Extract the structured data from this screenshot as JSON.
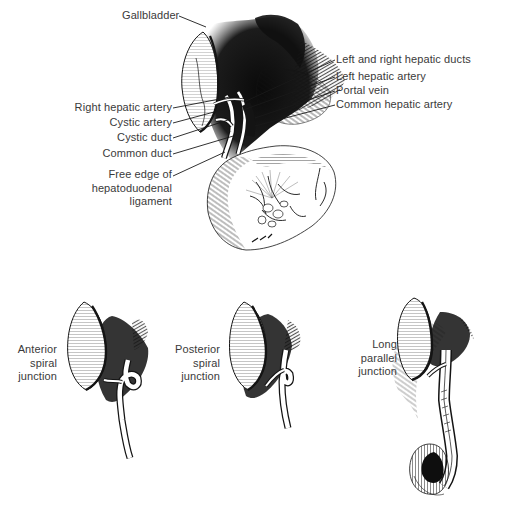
{
  "figure": {
    "background": "#ffffff",
    "ink_color": "#141414",
    "label_color": "#3a3a3a",
    "leader_color": "#1a1a1a"
  },
  "main_diagram": {
    "labels": [
      {
        "id": "gallbladder",
        "lines": [
          "Gallbladder"
        ],
        "align": "left",
        "x": 122,
        "y": 9,
        "leader": [
          [
            179,
            16
          ],
          [
            206,
            27
          ]
        ]
      },
      {
        "id": "left-right-hepatic-ducts",
        "lines": [
          "Left and right hepatic ducts"
        ],
        "align": "left",
        "x": 336,
        "y": 53,
        "leader": [
          [
            335,
            60
          ],
          [
            244,
            102
          ]
        ]
      },
      {
        "id": "left-hepatic-artery",
        "lines": [
          "Left hepatic artery"
        ],
        "align": "left",
        "x": 336,
        "y": 70,
        "leader": [
          [
            335,
            77
          ],
          [
            243,
            110
          ]
        ]
      },
      {
        "id": "portal-vein",
        "lines": [
          "Portal vein"
        ],
        "align": "left",
        "x": 336,
        "y": 84,
        "leader": [
          [
            335,
            91
          ],
          [
            255,
            118
          ]
        ]
      },
      {
        "id": "common-hepatic-artery",
        "lines": [
          "Common hepatic artery"
        ],
        "align": "left",
        "x": 336,
        "y": 98,
        "leader": [
          [
            335,
            105
          ],
          [
            255,
            126
          ]
        ]
      },
      {
        "id": "right-hepatic-artery",
        "lines": [
          "Right hepatic artery"
        ],
        "align": "right",
        "right": 348,
        "y": 101,
        "leader": [
          [
            173,
            108
          ],
          [
            230,
            97
          ]
        ]
      },
      {
        "id": "cystic-artery",
        "lines": [
          "Cystic artery"
        ],
        "align": "right",
        "right": 348,
        "y": 116,
        "leader": [
          [
            173,
            123
          ],
          [
            229,
            108
          ]
        ]
      },
      {
        "id": "cystic-duct",
        "lines": [
          "Cystic duct"
        ],
        "align": "right",
        "right": 348,
        "y": 131,
        "leader": [
          [
            173,
            138
          ],
          [
            228,
            120
          ]
        ]
      },
      {
        "id": "common-duct",
        "lines": [
          "Common duct"
        ],
        "align": "right",
        "right": 348,
        "y": 147,
        "leader": [
          [
            173,
            154
          ],
          [
            240,
            134
          ]
        ]
      },
      {
        "id": "free-edge",
        "lines": [
          "Free edge of",
          "hepatoduodenal",
          "ligament"
        ],
        "align": "right",
        "right": 348,
        "y": 168,
        "leader": [
          [
            173,
            176
          ],
          [
            225,
            152
          ]
        ]
      }
    ]
  },
  "variants": [
    {
      "id": "anterior-spiral",
      "lines": [
        "Anterior",
        "spiral",
        "junction"
      ],
      "right": 463,
      "y": 343
    },
    {
      "id": "posterior-spiral",
      "lines": [
        "Posterior",
        "spiral",
        "junction"
      ],
      "right": 300,
      "y": 343
    },
    {
      "id": "long-parallel",
      "lines": [
        "Long",
        "parallel",
        "junction"
      ],
      "right": 123,
      "y": 338
    }
  ]
}
